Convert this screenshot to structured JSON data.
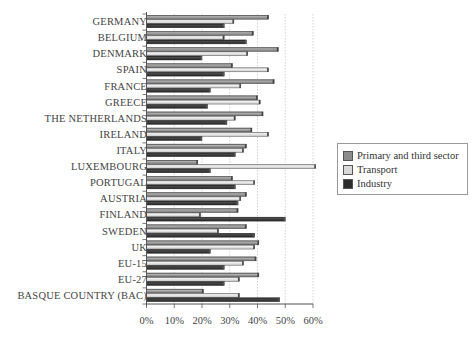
{
  "chart_data": {
    "type": "bar",
    "orientation": "horizontal",
    "title": "",
    "xlabel": "",
    "ylabel": "",
    "xlim": [
      0,
      60
    ],
    "x_ticks": [
      "0%",
      "10%",
      "20%",
      "30%",
      "40%",
      "50%",
      "60%"
    ],
    "grid": "vertical dotted gridlines",
    "legend_position": "right",
    "categories": [
      "GERMANY",
      "BELGIUM",
      "DENMARK",
      "SPAIN",
      "FRANCE",
      "GREECE",
      "THE NETHERLANDS",
      "IRELAND",
      "ITALY",
      "LUXEMBOURG",
      "PORTUGAL",
      "AUSTRIA",
      "FINLAND",
      "SWEDEN",
      "UK",
      "EU-15",
      "EU-27",
      "BASQUE COUNTRY (BAC)"
    ],
    "series": [
      {
        "name": "Primary and third sector",
        "color": "#8c8c8c",
        "values": [
          44,
          38.5,
          47.5,
          31,
          46,
          40,
          42,
          38,
          36,
          18.5,
          31,
          36,
          33,
          36,
          40.5,
          39.5,
          40.5,
          20.5
        ]
      },
      {
        "name": "Transport",
        "color": "#d9d9d9",
        "values": [
          31.5,
          28,
          36.5,
          44,
          34,
          41,
          32,
          44,
          35,
          61,
          39,
          34,
          19.5,
          26,
          39,
          35,
          33.5,
          33.5
        ]
      },
      {
        "name": "Industry",
        "color": "#2b2b2b",
        "values": [
          28,
          36,
          20,
          28,
          23,
          22,
          29,
          20,
          32,
          23,
          32,
          33,
          50,
          39,
          23,
          28,
          28,
          48
        ]
      }
    ]
  },
  "legend": {
    "items": [
      {
        "label": "Primary and third sector",
        "color": "#8c8c8c"
      },
      {
        "label": "Transport",
        "color": "#d9d9d9"
      },
      {
        "label": "Industry",
        "color": "#2b2b2b"
      }
    ]
  }
}
